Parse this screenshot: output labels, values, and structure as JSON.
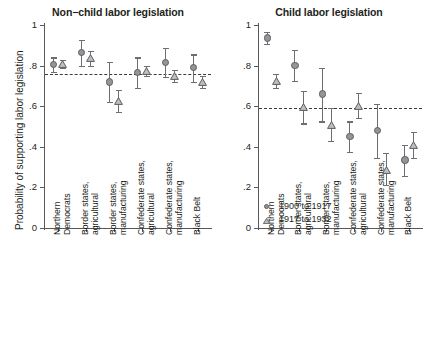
{
  "chart_data": {
    "type": "scatter",
    "title": "",
    "ylabel": "Probability of supporting labor legislation",
    "xlabel": "",
    "ylim": [
      0,
      1
    ],
    "yticks": [
      "0",
      ".2",
      ".4",
      ".6",
      ".8",
      "1"
    ],
    "ytick_values": [
      0,
      0.2,
      0.4,
      0.6,
      0.8,
      1
    ],
    "grid": false,
    "legend_position": "bottom-left of right panel",
    "legend": [
      {
        "label": "1900 to 1917",
        "marker": "circle"
      },
      {
        "label": "1917 to 1932",
        "marker": "triangle"
      }
    ],
    "categories": [
      "Northern Democrats",
      "Border states, agricultural",
      "Border states, manufacturing",
      "Confederate states, agricultural",
      "Confederate states, manufacturing",
      "Black Belt"
    ],
    "panels": [
      {
        "title": "Non−child labor legislation",
        "reference_line": 0.76,
        "series": [
          {
            "name": "1900 to 1917",
            "marker": "circle",
            "values": [
              0.805,
              0.865,
              0.72,
              0.765,
              0.815,
              0.79
            ],
            "ci_low": [
              0.77,
              0.8,
              0.62,
              0.69,
              0.745,
              0.72
            ],
            "ci_high": [
              0.84,
              0.925,
              0.82,
              0.84,
              0.885,
              0.855
            ]
          },
          {
            "name": "1917 to 1932",
            "marker": "triangle",
            "values": [
              0.81,
              0.835,
              0.625,
              0.775,
              0.75,
              0.72
            ],
            "ci_low": [
              0.79,
              0.8,
              0.57,
              0.75,
              0.72,
              0.69
            ],
            "ci_high": [
              0.83,
              0.87,
              0.68,
              0.8,
              0.78,
              0.75
            ]
          }
        ]
      },
      {
        "title": "Child labor legislation",
        "reference_line": 0.59,
        "series": [
          {
            "name": "1900 to 1917",
            "marker": "circle",
            "values": [
              0.935,
              0.8,
              0.66,
              0.45,
              0.48,
              0.335
            ],
            "ci_low": [
              0.905,
              0.725,
              0.525,
              0.375,
              0.345,
              0.255
            ],
            "ci_high": [
              0.965,
              0.875,
              0.79,
              0.525,
              0.61,
              0.41
            ]
          },
          {
            "name": "1917 to 1932",
            "marker": "triangle",
            "values": [
              0.725,
              0.595,
              0.505,
              0.6,
              0.285,
              0.41
            ],
            "ci_low": [
              0.69,
              0.515,
              0.43,
              0.54,
              0.21,
              0.345
            ],
            "ci_high": [
              0.76,
              0.675,
              0.59,
              0.665,
              0.37,
              0.475
            ]
          }
        ]
      }
    ],
    "colors": {
      "marker_fill": "#939598",
      "marker_edge": "#5b5c5e",
      "axis": "#58595b",
      "refline": "#3b3b3d",
      "text": "#231f20"
    }
  }
}
